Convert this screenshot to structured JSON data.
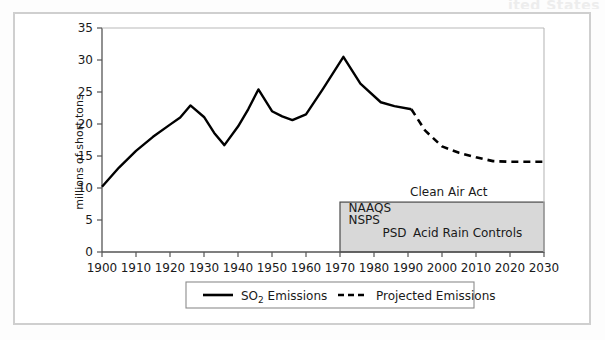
{
  "page": {
    "top_fragment": "ited States",
    "background": "#ffffff",
    "frame_color": "#cfcfcf"
  },
  "chart_data": {
    "type": "line",
    "title": "",
    "xlabel": "",
    "ylabel": "millions of short tons",
    "xlim": [
      1900,
      2030
    ],
    "ylim": [
      0,
      35
    ],
    "xticks": [
      1900,
      1910,
      1920,
      1930,
      1940,
      1950,
      1960,
      1970,
      1980,
      1990,
      2000,
      2010,
      2020,
      2030
    ],
    "yticks": [
      0,
      5,
      10,
      15,
      20,
      25,
      30,
      35
    ],
    "grid": false,
    "legend_position": "below",
    "colors": {
      "line": "#000000",
      "shaded_box_fill": "#d8d8d8",
      "shaded_box_stroke": "#4a4a4a",
      "axis": "#555555",
      "text": "#1a1a1a"
    },
    "series": [
      {
        "name": "SO2 Emissions",
        "legend_label": "SO",
        "legend_sub": "2",
        "legend_label_tail": " Emissions",
        "style": "solid",
        "points": [
          [
            1900,
            10.2
          ],
          [
            1905,
            13.2
          ],
          [
            1910,
            15.8
          ],
          [
            1915,
            18.0
          ],
          [
            1920,
            19.9
          ],
          [
            1923,
            21.0
          ],
          [
            1926,
            22.9
          ],
          [
            1930,
            21.1
          ],
          [
            1933,
            18.6
          ],
          [
            1936,
            16.7
          ],
          [
            1940,
            19.6
          ],
          [
            1943,
            22.3
          ],
          [
            1946,
            25.4
          ],
          [
            1950,
            22.0
          ],
          [
            1953,
            21.2
          ],
          [
            1956,
            20.6
          ],
          [
            1960,
            21.5
          ],
          [
            1965,
            25.5
          ],
          [
            1971,
            30.5
          ],
          [
            1976,
            26.3
          ],
          [
            1982,
            23.4
          ],
          [
            1986,
            22.8
          ],
          [
            1991,
            22.3
          ]
        ]
      },
      {
        "name": "Projected Emissions",
        "legend_label": "Projected Emissions",
        "style": "dashed",
        "points": [
          [
            1991,
            22.3
          ],
          [
            1995,
            19.0
          ],
          [
            2000,
            16.5
          ],
          [
            2005,
            15.5
          ],
          [
            2010,
            14.8
          ],
          [
            2015,
            14.2
          ],
          [
            2020,
            14.1
          ],
          [
            2025,
            14.1
          ],
          [
            2030,
            14.1
          ]
        ]
      }
    ],
    "annotations": [
      {
        "name": "clean-air-act-label",
        "text": "Clean Air Act",
        "x": 2002,
        "y": 8.8,
        "align": "middle"
      },
      {
        "name": "naaqs-label",
        "text": "NAAQS",
        "x": 1972.5,
        "y": 6.3,
        "align": "start"
      },
      {
        "name": "nsps-label",
        "text": "NSPS",
        "x": 1972.5,
        "y": 4.4,
        "align": "start"
      },
      {
        "name": "psd-label",
        "text": "PSD",
        "x": 1982.5,
        "y": 2.4,
        "align": "start"
      },
      {
        "name": "acid-rain-controls-label",
        "text": "Acid Rain Controls",
        "x": 1991.5,
        "y": 2.4,
        "align": "start"
      }
    ],
    "shaded_region": {
      "name": "clean-air-act-region",
      "x_start": 1970,
      "x_end": 2030,
      "y_start": 0,
      "y_end": 7.8
    }
  },
  "legend": {
    "items": [
      {
        "label_main": "SO",
        "label_sub": "2",
        "label_tail": " Emissions",
        "style": "solid"
      },
      {
        "label_main": "Projected Emissions",
        "label_sub": "",
        "label_tail": "",
        "style": "dashed"
      }
    ]
  }
}
